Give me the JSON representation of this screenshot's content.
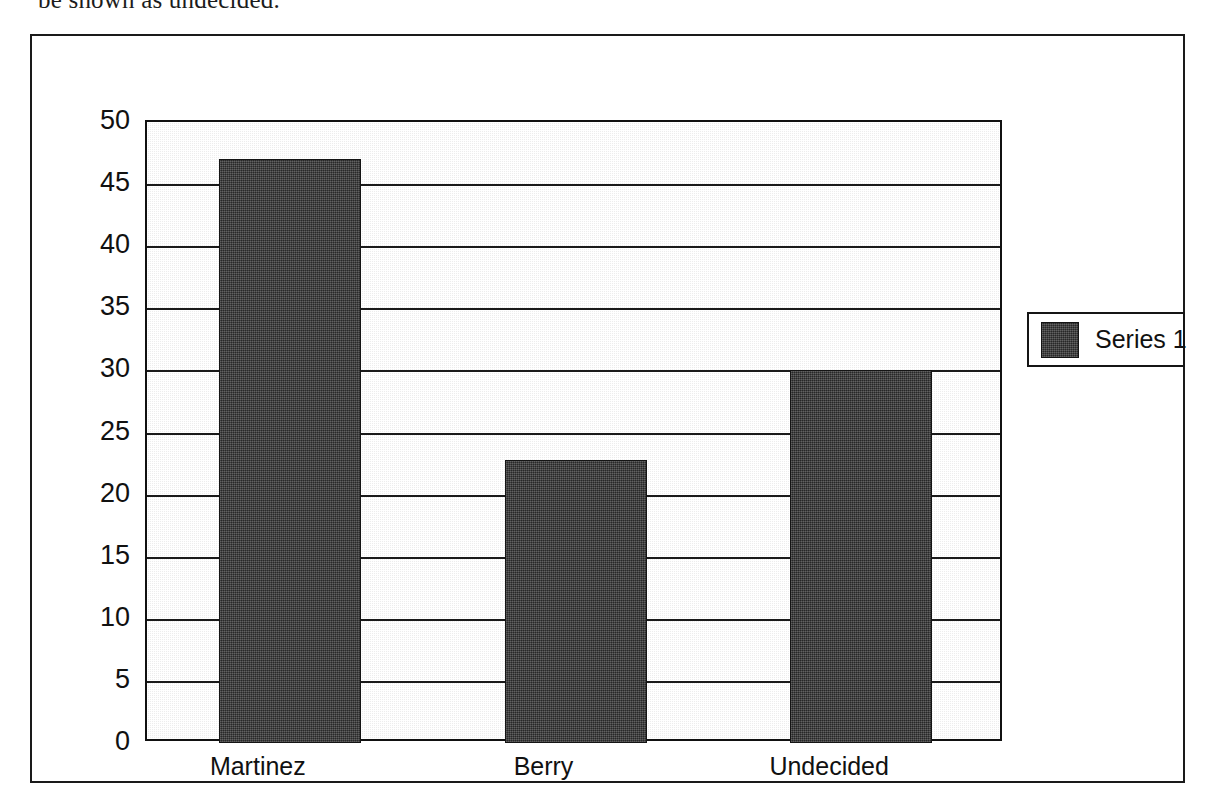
{
  "page": {
    "clipped_caption": "be shown as undecided."
  },
  "chart_data": {
    "type": "bar",
    "title": "",
    "subtitle": "",
    "xlabel": "",
    "ylabel": "",
    "categories": [
      "Martinez",
      "Berry",
      "Undecided"
    ],
    "values": [
      47,
      22.8,
      30
    ],
    "series": [
      {
        "name": "Series 1",
        "values": [
          47,
          22.8,
          30
        ]
      }
    ],
    "ylim": [
      0,
      50
    ],
    "yticks": [
      0,
      5,
      10,
      15,
      20,
      25,
      30,
      35,
      40,
      45,
      50
    ],
    "ytick_labels": [
      "0",
      "5",
      "10",
      "15",
      "20",
      "25",
      "30",
      "35",
      "40",
      "45",
      "50"
    ],
    "grid": true,
    "grid_axis": "y",
    "legend": {
      "position": "right",
      "entries": [
        {
          "label": "Series 1",
          "color": "#3b3b3b"
        }
      ]
    },
    "colors": {
      "bar_fill": "#3b3b3b",
      "plot_background": "#ededed",
      "gridline": "#1a1a1a",
      "frame": "#1a1a1a",
      "text": "#111111"
    }
  }
}
